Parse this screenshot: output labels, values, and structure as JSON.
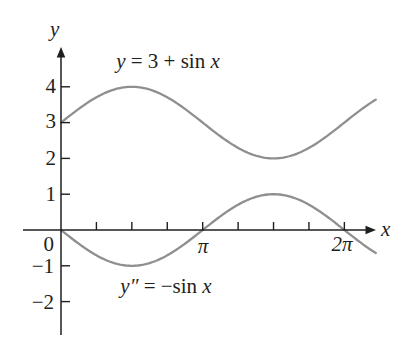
{
  "figure": {
    "background": "#ffffff",
    "axis_color": "#1f1f1f",
    "curve_color": "#8f8f8f"
  },
  "chart_data": {
    "type": "line",
    "title": "",
    "x_axis": {
      "label": "x",
      "range_rad": [
        0,
        6.98
      ],
      "tick_step_rad": 0.7853981634,
      "num_ticks": 8,
      "labeled_ticks": [
        {
          "x_rad": 3.14159265,
          "label": "π"
        },
        {
          "x_rad": 6.28318531,
          "label": "2π"
        }
      ]
    },
    "y_axis": {
      "label": "y",
      "origin_label": "0",
      "ticks": [
        {
          "value": 4,
          "label": "4"
        },
        {
          "value": 3,
          "label": "3"
        },
        {
          "value": 2,
          "label": "2"
        },
        {
          "value": 1,
          "label": "1"
        },
        {
          "value": -1,
          "label": "−1"
        },
        {
          "value": -2,
          "label": "−2"
        }
      ]
    },
    "series": [
      {
        "name": "y = 3 + sin x",
        "equation_parts": {
          "lhs": "y",
          "mid": " = 3 + sin ",
          "arg": "x"
        },
        "offset": 3,
        "amplitude": 1,
        "x_quarter_pi_units": [
          0,
          1,
          2,
          3,
          4,
          5,
          6,
          7,
          8
        ],
        "values": [
          3,
          3.71,
          4,
          3.71,
          3,
          2.29,
          2,
          2.29,
          3
        ]
      },
      {
        "name": "y″ = −sin x",
        "equation_parts": {
          "lhs": "y″",
          "mid": " = −sin ",
          "arg": "x"
        },
        "offset": 0,
        "amplitude": -1,
        "x_quarter_pi_units": [
          0,
          1,
          2,
          3,
          4,
          5,
          6,
          7,
          8
        ],
        "values": [
          0,
          -0.71,
          -1,
          -0.71,
          0,
          0.71,
          1,
          0.71,
          0
        ]
      }
    ]
  }
}
